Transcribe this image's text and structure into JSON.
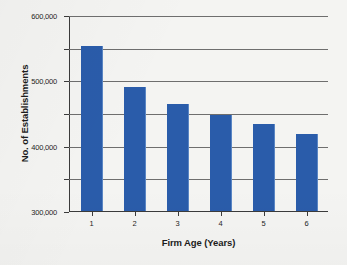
{
  "chart_data": {
    "type": "bar",
    "title": "",
    "xlabel": "Firm Age (Years)",
    "ylabel": "No. of Establishments",
    "categories": [
      "1",
      "2",
      "3",
      "4",
      "5",
      "6"
    ],
    "values": [
      508000,
      383000,
      330000,
      295000,
      268000,
      237000
    ],
    "series": [
      {
        "name": "No. of Establishments",
        "values": [
          508000,
          383000,
          330000,
          295000,
          268000,
          237000
        ]
      }
    ],
    "ylim": [
      0,
      600000
    ],
    "ytick_values": [
      0,
      100000,
      200000,
      300000,
      400000,
      500000,
      600000
    ],
    "ytick_labels": [
      "0.00",
      "100,000",
      "200,000",
      "300,000",
      "400,000",
      "500,000",
      "600,000"
    ],
    "grid": true,
    "legend": false,
    "legend_position": "none",
    "bar_color": "#2a5caa",
    "background_color": "#f4f4f2",
    "axis_color": "#3b3b3b",
    "gridline_color": "#6e6e6e"
  }
}
